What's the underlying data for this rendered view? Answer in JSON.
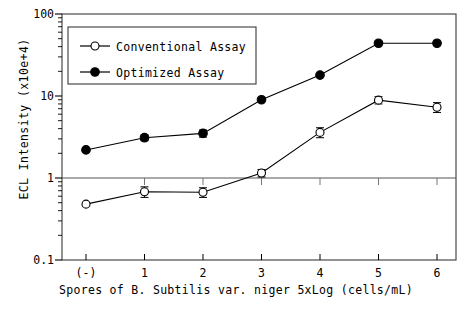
{
  "chart_data": {
    "type": "line",
    "title": "",
    "xlabel": "Spores of  B. Subtilis var. niger   5xLog (cells/mL)",
    "ylabel": "ECL Intensity  (x10e+4)",
    "categories": [
      "(-)",
      "1",
      "2",
      "3",
      "4",
      "5",
      "6"
    ],
    "yscale": "log",
    "ylim": [
      0.1,
      100
    ],
    "ytick_labels": [
      "100",
      "10",
      "1",
      "0.1"
    ],
    "ytick_values": [
      100,
      10,
      1,
      0.1
    ],
    "grid": "horizontal-at-1",
    "legend_position": "upper-left-inside",
    "series": [
      {
        "name": "Conventional Assay",
        "marker": "open-circle",
        "values": [
          0.48,
          0.68,
          0.67,
          1.15,
          3.6,
          8.9,
          7.3
        ],
        "errors": [
          0.0,
          0.1,
          0.09,
          0.12,
          0.5,
          0.9,
          1.0
        ]
      },
      {
        "name": "Optimized Assay",
        "marker": "filled-circle",
        "values": [
          2.2,
          3.1,
          3.5,
          9.0,
          18.0,
          44.0,
          44.0
        ],
        "errors": [
          0.0,
          0.25,
          0.35,
          0.0,
          0.0,
          0.0,
          0.0
        ]
      }
    ],
    "colors": {
      "axis": "#000000",
      "series_conventional": "#000000",
      "series_optimized": "#000000",
      "background": "#ffffff"
    }
  },
  "legend": {
    "items": [
      {
        "label": "Conventional Assay"
      },
      {
        "label": "Optimized Assay"
      }
    ]
  }
}
